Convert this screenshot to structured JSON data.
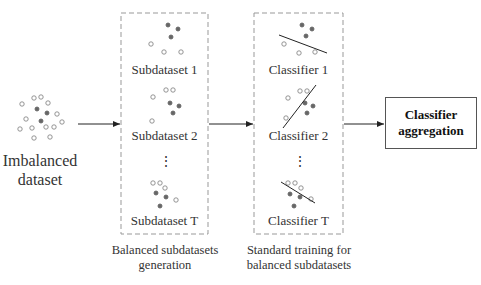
{
  "input": {
    "label_line1": "Imbalanced",
    "label_line2": "dataset"
  },
  "subdatasets": {
    "items": [
      "Subdataset 1",
      "Subdataset 2",
      "Subdataset T"
    ],
    "ellipsis": "⋮",
    "caption_line1": "Balanced subdatasets",
    "caption_line2": "generation"
  },
  "classifiers": {
    "items": [
      "Classifier 1",
      "Classifier 2",
      "Classifier T"
    ],
    "ellipsis": "⋮",
    "caption_line1": "Standard training for",
    "caption_line2": "balanced subdatasets"
  },
  "aggregation": {
    "label_line1": "Classifier",
    "label_line2": "aggregation"
  },
  "colors": {
    "filled_point": "#666666",
    "hollow_point": "#888888",
    "dashed_border": "#999999",
    "arrow": "#222222"
  }
}
